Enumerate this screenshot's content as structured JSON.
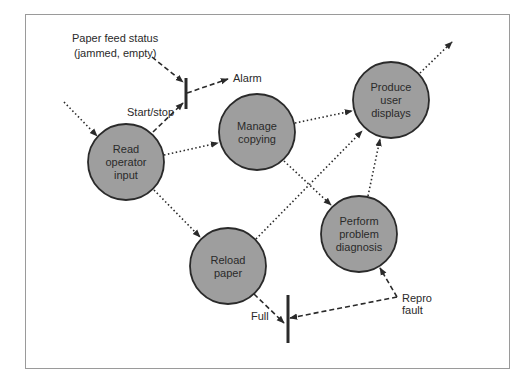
{
  "diagram": {
    "type": "data-flow-diagram",
    "nodes": [
      {
        "id": "read",
        "lines": [
          "Read",
          "operator",
          "input"
        ],
        "cx": 126,
        "cy": 162,
        "r": 38
      },
      {
        "id": "manage",
        "lines": [
          "Manage",
          "copying"
        ],
        "cx": 257,
        "cy": 132,
        "r": 38
      },
      {
        "id": "produce",
        "lines": [
          "Produce",
          "user",
          "displays"
        ],
        "cx": 391,
        "cy": 100,
        "r": 38
      },
      {
        "id": "diagnose",
        "lines": [
          "Perform",
          "problem",
          "diagnosis"
        ],
        "cx": 359,
        "cy": 234,
        "r": 38
      },
      {
        "id": "reload",
        "lines": [
          "Reload",
          "paper"
        ],
        "cx": 228,
        "cy": 266,
        "r": 38
      }
    ],
    "external_labels": {
      "paper_feed_line1": "Paper feed status",
      "paper_feed_line2": "(jammed, empty)",
      "alarm": "Alarm",
      "start_stop": "Start/stop",
      "full": "Full",
      "repro_line1": "Repro",
      "repro_line2": "fault"
    },
    "edges": [
      {
        "from": "external",
        "to": "read",
        "style": "dotted"
      },
      {
        "from": "read",
        "to": "manage",
        "style": "dotted"
      },
      {
        "from": "read",
        "to": "reload",
        "style": "dotted"
      },
      {
        "from": "read",
        "to": "start/stop-bar",
        "style": "dashed",
        "label": "Start/stop"
      },
      {
        "from": "paper-feed-status",
        "to": "start/stop-bar",
        "style": "dashed"
      },
      {
        "from": "start/stop-bar",
        "to": "alarm",
        "style": "dashed"
      },
      {
        "from": "manage",
        "to": "produce",
        "style": "dotted"
      },
      {
        "from": "manage",
        "to": "diagnose",
        "style": "dotted"
      },
      {
        "from": "reload",
        "to": "produce",
        "style": "dotted"
      },
      {
        "from": "diagnose",
        "to": "produce",
        "style": "dotted"
      },
      {
        "from": "produce",
        "to": "external",
        "style": "dotted"
      },
      {
        "from": "reload",
        "to": "full-bar",
        "style": "dashed",
        "label": "Full"
      },
      {
        "from": "repro-fault",
        "to": "full-bar",
        "style": "dashed"
      },
      {
        "from": "repro-fault",
        "to": "diagnose",
        "style": "dashed"
      }
    ],
    "colors": {
      "node_fill": "#9e9e9e",
      "node_stroke": "#2a2a2a",
      "line": "#2a2a2a",
      "border": "#9a9a9a"
    }
  }
}
